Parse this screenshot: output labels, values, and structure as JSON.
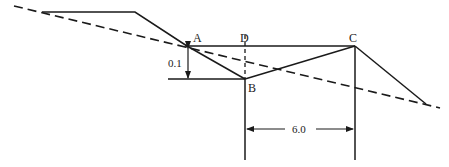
{
  "diagram": {
    "points": {
      "A": {
        "label": "A",
        "x": 187,
        "y": 46
      },
      "B": {
        "label": "B",
        "x": 245,
        "y": 79
      },
      "C": {
        "label": "C",
        "x": 355,
        "y": 46
      },
      "D": {
        "label": "D",
        "x": 245,
        "y": 46
      }
    },
    "dimensions": {
      "vertical_drop": "0.1",
      "horizontal_span": "6.0"
    },
    "colors": {
      "stroke": "#1a1a1a",
      "background": "#ffffff"
    }
  }
}
